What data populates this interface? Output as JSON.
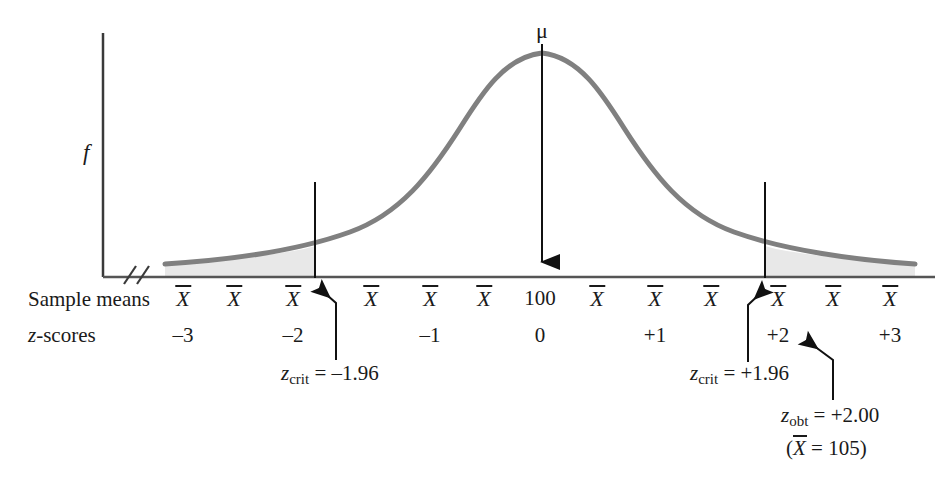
{
  "figure": {
    "axis": {
      "y_label": "f",
      "break_symbol": "//",
      "baseline_color": "#555555",
      "curve_color": "#808080",
      "shade_color": "#e8e8e8"
    },
    "mean_marker": {
      "label": "μ",
      "center_value": "100",
      "center_z": "0"
    },
    "rows": {
      "sample_means_label": "Sample means",
      "z_scores_label": "z-scores",
      "xbar_symbol": "X"
    },
    "ticks": [
      {
        "x": 183,
        "xbar": "X",
        "z": "–3"
      },
      {
        "x": 234,
        "xbar": "X",
        "z": ""
      },
      {
        "x": 293,
        "xbar": "X",
        "z": "–2"
      },
      {
        "x": 371,
        "xbar": "X",
        "z": ""
      },
      {
        "x": 430,
        "xbar": "X",
        "z": "–1"
      },
      {
        "x": 484,
        "xbar": "X",
        "z": ""
      },
      {
        "x": 540,
        "xbar": "100",
        "z": "0"
      },
      {
        "x": 597,
        "xbar": "X",
        "z": ""
      },
      {
        "x": 655,
        "xbar": "X",
        "z": "+1"
      },
      {
        "x": 711,
        "xbar": "X",
        "z": ""
      },
      {
        "x": 778,
        "xbar": "X",
        "z": "+2"
      },
      {
        "x": 833,
        "xbar": "X",
        "z": ""
      },
      {
        "x": 890,
        "xbar": "X",
        "z": "+3"
      }
    ],
    "annotations": {
      "z_crit_left": {
        "var": "z",
        "sub": "crit",
        "value": "= –1.96"
      },
      "z_crit_right": {
        "var": "z",
        "sub": "crit",
        "value": "= +1.96"
      },
      "z_obt": {
        "var": "z",
        "sub": "obt",
        "value": "= +2.00"
      },
      "x_bar_obt": {
        "open": "(",
        "var": "X",
        "value": "= 105)"
      }
    }
  },
  "chart_data": {
    "type": "line",
    "xlabel": "Sample means / z-scores",
    "ylabel": "f",
    "grid": false,
    "legend": null,
    "x_tick_labels_row1": [
      "X̄",
      "X̄",
      "X̄",
      "X̄",
      "X̄",
      "X̄",
      "100",
      "X̄",
      "X̄",
      "X̄",
      "X̄",
      "X̄",
      "X̄"
    ],
    "x_tick_labels_row2": [
      "–3",
      "",
      "–2",
      "",
      "–1",
      "",
      "0",
      "",
      "+1",
      "",
      "+2",
      "",
      "+3"
    ],
    "z_axis_range": [
      -3.6,
      3.6
    ],
    "distribution": {
      "shape": "normal",
      "mean_z": 0,
      "mean_value": 100,
      "sd_value": 2.5,
      "peak_pixel": {
        "x": 542,
        "y": 52
      },
      "baseline_pixel_y": 278
    },
    "critical_values": {
      "lower": -1.96,
      "upper": 1.96
    },
    "obtained_value": {
      "z": 2.0,
      "x_bar": 105
    },
    "shaded_regions": [
      {
        "name": "lower-rejection-region",
        "from_z": -3.6,
        "to_z": -1.96
      },
      {
        "name": "upper-rejection-region",
        "from_z": 1.96,
        "to_z": 3.6
      }
    ],
    "annotations": [
      {
        "text": "μ",
        "at_z": 0
      },
      {
        "text": "z_crit = –1.96",
        "at_z": -1.96
      },
      {
        "text": "z_crit = +1.96",
        "at_z": 1.96
      },
      {
        "text": "z_obt = +2.00 (X̄ = 105)",
        "at_z": 2.0
      }
    ]
  }
}
